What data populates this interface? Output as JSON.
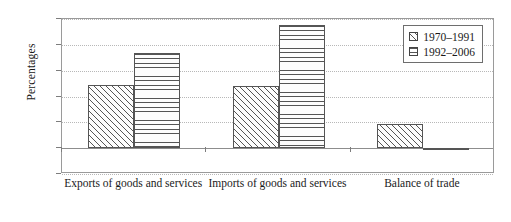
{
  "chart_data": {
    "type": "bar",
    "title": "",
    "xlabel": "",
    "ylabel": "Percentages",
    "categories": [
      "Exports of goods and services",
      "Imports of goods and services",
      "Balance of trade"
    ],
    "series": [
      {
        "name": "1970–1991",
        "values": [
          4.9,
          4.8,
          1.9
        ],
        "pattern": "diagonal-hatch"
      },
      {
        "name": "1992–2006",
        "values": [
          7.4,
          9.5,
          -0.1
        ],
        "pattern": "horizontal-hatch"
      }
    ],
    "ylim": [
      -2,
      10
    ],
    "yticks": [
      "10",
      "8",
      "6",
      "4",
      "2",
      "0",
      "-2"
    ],
    "ytick_values": [
      10,
      8,
      6,
      4,
      2,
      0,
      -2
    ],
    "grid": true,
    "legend_position": "top-right"
  },
  "legend": {
    "items": [
      {
        "label": "1970–1991",
        "marker": "diagonal-hatch-swatch"
      },
      {
        "label": "1992–2006",
        "marker": "horizontal-hatch-swatch"
      }
    ]
  },
  "colors": {
    "bar_outline": "#555555",
    "bar_fill": "#fdfdfd",
    "gridline": "#b8b8b8",
    "axis": "#8d8d8d",
    "text": "#1a1a1a",
    "background": "#ffffff"
  }
}
